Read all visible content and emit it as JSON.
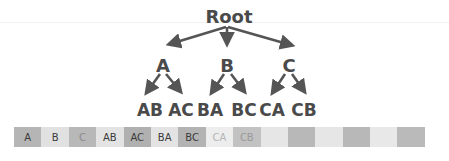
{
  "diagram": {
    "root": {
      "label": "Root",
      "x": 229,
      "y": 23
    },
    "level1": [
      {
        "label": "A",
        "x": 163,
        "y": 72
      },
      {
        "label": "B",
        "x": 227,
        "y": 72
      },
      {
        "label": "C",
        "x": 289,
        "y": 72
      }
    ],
    "level2": [
      {
        "label": "AB",
        "parent": "A",
        "x": 150,
        "y": 116
      },
      {
        "label": "AC",
        "parent": "A",
        "x": 181,
        "y": 116
      },
      {
        "label": "BA",
        "parent": "B",
        "x": 210,
        "y": 116
      },
      {
        "label": "BC",
        "parent": "B",
        "x": 244,
        "y": 116
      },
      {
        "label": "CA",
        "parent": "C",
        "x": 272,
        "y": 116
      },
      {
        "label": "CB",
        "parent": "C",
        "x": 304,
        "y": 116
      }
    ],
    "edges": [
      {
        "from": "Root",
        "to": "A",
        "x1": 226,
        "y1": 27,
        "x2": 170,
        "y2": 44
      },
      {
        "from": "Root",
        "to": "B",
        "x1": 227,
        "y1": 27,
        "x2": 227,
        "y2": 43
      },
      {
        "from": "Root",
        "to": "C",
        "x1": 228,
        "y1": 27,
        "x2": 291,
        "y2": 45
      },
      {
        "from": "A",
        "to": "AB",
        "x1": 160,
        "y1": 74,
        "x2": 147,
        "y2": 92
      },
      {
        "from": "A",
        "to": "AC",
        "x1": 166,
        "y1": 74,
        "x2": 180,
        "y2": 91
      },
      {
        "from": "B",
        "to": "BA",
        "x1": 224,
        "y1": 74,
        "x2": 212,
        "y2": 92
      },
      {
        "from": "B",
        "to": "BC",
        "x1": 231,
        "y1": 74,
        "x2": 244,
        "y2": 91
      },
      {
        "from": "C",
        "to": "CA",
        "x1": 285,
        "y1": 74,
        "x2": 273,
        "y2": 92
      },
      {
        "from": "C",
        "to": "CB",
        "x1": 292,
        "y1": 74,
        "x2": 304,
        "y2": 91
      }
    ],
    "colors": {
      "text": "#4a4a4a",
      "arrow": "#555555",
      "faint_line": "#f1f1f1"
    }
  },
  "array_bar": {
    "cells": [
      {
        "label": "A",
        "bg": "#b5b5b5",
        "fg": "#3a3a3a"
      },
      {
        "label": "B",
        "bg": "#e1e1e1",
        "fg": "#3a3a3a"
      },
      {
        "label": "C",
        "bg": "#b8b8b8",
        "fg": "#8a8a8a"
      },
      {
        "label": "AB",
        "bg": "#e3e3e3",
        "fg": "#3a3a3a"
      },
      {
        "label": "AC",
        "bg": "#b0b0b0",
        "fg": "#3a3a3a"
      },
      {
        "label": "BA",
        "bg": "#e3e3e3",
        "fg": "#3a3a3a"
      },
      {
        "label": "BC",
        "bg": "#b3b3b3",
        "fg": "#3a3a3a"
      },
      {
        "label": "CA",
        "bg": "#ededed",
        "fg": "#b5b5b5"
      },
      {
        "label": "CB",
        "bg": "#c2c2c2",
        "fg": "#9a9a9a"
      },
      {
        "label": "",
        "bg": "#e6e6e6",
        "fg": "#3a3a3a"
      },
      {
        "label": "",
        "bg": "#b8b8b8",
        "fg": "#3a3a3a"
      },
      {
        "label": "",
        "bg": "#e6e6e6",
        "fg": "#3a3a3a"
      },
      {
        "label": "",
        "bg": "#b8b8b8",
        "fg": "#3a3a3a"
      },
      {
        "label": "",
        "bg": "#e8e8e8",
        "fg": "#3a3a3a"
      },
      {
        "label": "",
        "bg": "#bababa",
        "fg": "#3a3a3a"
      }
    ]
  }
}
